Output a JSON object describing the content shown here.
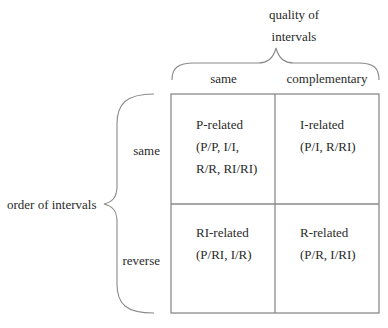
{
  "diagram": {
    "column_axis": {
      "title": "quality of\nintervals",
      "columns": [
        "same",
        "complementary"
      ]
    },
    "row_axis": {
      "title": "order of intervals",
      "rows": [
        "same",
        "reverse"
      ]
    },
    "cells": [
      [
        {
          "title": "P-related",
          "members": "(P/P, I/I,\nR/R, RI/RI)"
        },
        {
          "title": "I-related",
          "members": "(P/I, R/RI)"
        }
      ],
      [
        {
          "title": "RI-related",
          "members": "(P/RI, I/R)"
        },
        {
          "title": "R-related",
          "members": "(P/R, I/RI)"
        }
      ]
    ],
    "colors": {
      "line": "#8a8a8a",
      "text": "#2a2a2a",
      "background": "#ffffff"
    }
  }
}
